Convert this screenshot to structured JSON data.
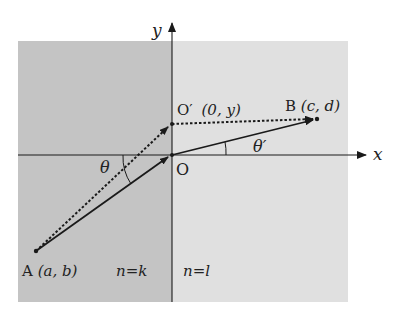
{
  "colors": {
    "background": "#ffffff",
    "region_left": "#c4c4c4",
    "region_right": "#e0e0e0",
    "ink": "#1a1a1a"
  },
  "axes": {
    "x_label": "x",
    "y_label": "y",
    "origin_label": "O"
  },
  "points": {
    "A": {
      "name": "A",
      "coords": "(a, b)"
    },
    "B": {
      "name": "B",
      "coords": "(c, d)"
    },
    "O_prime": {
      "name": "O′",
      "coords": "(0, y)"
    }
  },
  "angles": {
    "theta": "θ",
    "theta_prime": "θ′"
  },
  "regions": {
    "left": "n=k",
    "right": "n=l"
  }
}
